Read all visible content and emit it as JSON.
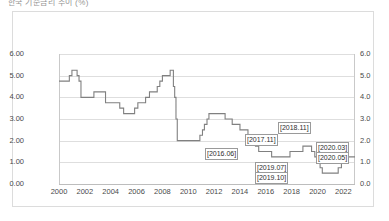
{
  "chart_title": "한국 기준금리 추이 (%)",
  "chart_data": {
    "type": "line",
    "title": "한국 기준금리 추이 (%)",
    "xlabel": "",
    "ylabel": "",
    "grid": true,
    "legend": "none",
    "step": "post",
    "line_color": "#808080",
    "xlim": [
      2000,
      2022.9
    ],
    "ylim": [
      0.0,
      6.0
    ],
    "y_left_ticks": [
      "0.00",
      "1.00",
      "2.00",
      "3.00",
      "4.00",
      "5.00",
      "6.00"
    ],
    "y_right_ticks": [
      "0.0",
      "1.0",
      "2.0",
      "3.0",
      "4.0",
      "5.0",
      "6.0"
    ],
    "y_tick_values": [
      0,
      1,
      2,
      3,
      4,
      5,
      6
    ],
    "x_ticks": [
      "2000",
      "2002",
      "2004",
      "2006",
      "2008",
      "2010",
      "2012",
      "2014",
      "2016",
      "2018",
      "2020",
      "2022"
    ],
    "x_tick_values": [
      2000,
      2002,
      2004,
      2006,
      2008,
      2010,
      2012,
      2014,
      2016,
      2018,
      2020,
      2022
    ],
    "series": [
      {
        "name": "기준금리",
        "x": [
          2000.0,
          2000.3,
          2000.8,
          2001.0,
          2001.15,
          2001.4,
          2001.55,
          2001.7,
          2002.4,
          2002.7,
          2003.0,
          2003.4,
          2003.6,
          2004.0,
          2004.7,
          2005.0,
          2005.4,
          2005.85,
          2006.1,
          2006.45,
          2006.7,
          2007.0,
          2007.6,
          2007.8,
          2008.0,
          2008.6,
          2008.78,
          2008.85,
          2008.95,
          2009.05,
          2009.15,
          2010.0,
          2010.55,
          2010.9,
          2011.1,
          2011.25,
          2011.45,
          2011.6,
          2012.5,
          2012.85,
          2013.4,
          2014.0,
          2014.62,
          2014.85,
          2015.2,
          2015.45,
          2016.0,
          2016.45,
          2017.0,
          2017.87,
          2018.0,
          2018.87,
          2019.0,
          2019.54,
          2019.79,
          2020.0,
          2020.2,
          2020.37,
          2021.0,
          2021.6,
          2021.85,
          2022.0,
          2022.2
        ],
        "values": [
          4.75,
          4.75,
          5.0,
          5.25,
          5.25,
          5.0,
          4.75,
          4.0,
          4.0,
          4.25,
          4.25,
          4.25,
          3.75,
          3.75,
          3.5,
          3.25,
          3.25,
          3.5,
          3.75,
          3.75,
          4.0,
          4.25,
          4.5,
          4.75,
          5.0,
          5.25,
          5.25,
          4.5,
          4.0,
          3.0,
          2.0,
          2.0,
          2.0,
          2.25,
          2.5,
          2.75,
          3.0,
          3.25,
          3.25,
          3.0,
          2.75,
          2.5,
          2.25,
          2.0,
          1.75,
          1.5,
          1.5,
          1.25,
          1.25,
          1.5,
          1.5,
          1.75,
          1.75,
          1.5,
          1.25,
          1.25,
          0.75,
          0.5,
          0.5,
          0.75,
          1.0,
          1.0,
          1.25
        ]
      }
    ],
    "annotations": [
      {
        "label": "[2016.06]",
        "value": 1.25
      },
      {
        "label": "[2017.11]",
        "value": 1.5
      },
      {
        "label": "[2018.11]",
        "value": 1.75
      },
      {
        "label": "[2019.07]",
        "value": 1.5
      },
      {
        "label": "[2019.10]",
        "value": 1.25
      },
      {
        "label": "[2020.03]",
        "value": 0.75
      },
      {
        "label": "[2020.05]",
        "value": 0.5
      }
    ]
  }
}
